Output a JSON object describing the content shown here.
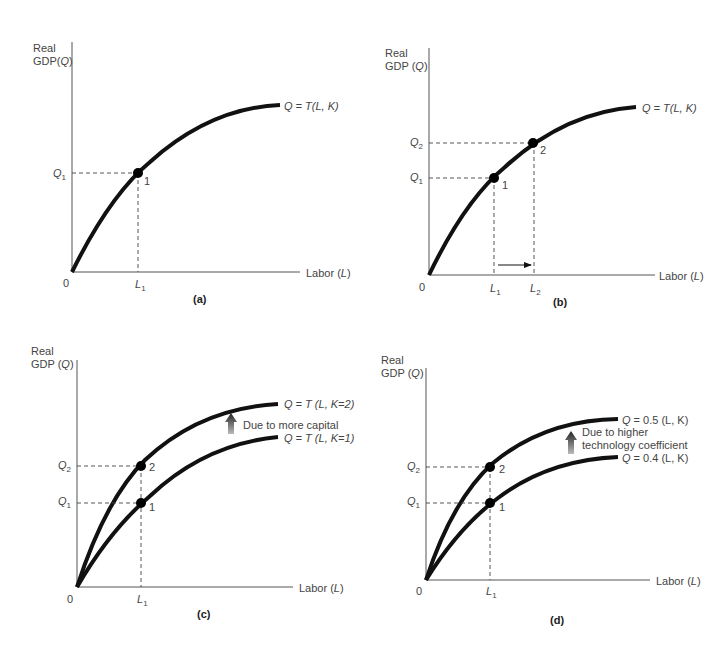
{
  "figure": {
    "panels": [
      {
        "id": "a",
        "caption": "(a)",
        "y_label_line1": "Real",
        "y_label_line2": "GDP(",
        "y_label_var": "Q",
        "x_label": "Labor (",
        "x_label_var": "L",
        "origin": "0",
        "curves": [
          {
            "label_pre": "Q",
            "label_text": " = T(L, K)"
          }
        ],
        "q_ticks": [
          {
            "base": "Q",
            "sub": "1"
          }
        ],
        "l_ticks": [
          {
            "base": "L",
            "sub": "1"
          }
        ],
        "points": [
          "1"
        ]
      },
      {
        "id": "b",
        "caption": "(b)",
        "y_label_line1": "Real",
        "y_label_line2": "GDP (",
        "y_label_var": "Q",
        "x_label": "Labor (",
        "x_label_var": "L",
        "origin": "0",
        "curves": [
          {
            "label_pre": "Q",
            "label_text": " = T(L, K)"
          }
        ],
        "q_ticks": [
          {
            "base": "Q",
            "sub": "1"
          },
          {
            "base": "Q",
            "sub": "2"
          }
        ],
        "l_ticks": [
          {
            "base": "L",
            "sub": "1"
          },
          {
            "base": "L",
            "sub": "2"
          }
        ],
        "points": [
          "1",
          "2"
        ],
        "annotation": "arrow from L1 to L2 (increase in labor)"
      },
      {
        "id": "c",
        "caption": "(c)",
        "y_label_line1": "Real",
        "y_label_line2": "GDP (",
        "y_label_var": "Q",
        "x_label": "Labor (",
        "x_label_var": "L",
        "origin": "0",
        "curves": [
          {
            "label_pre": "Q",
            "label_text": " = T (L, K=2)"
          },
          {
            "label_pre": "Q",
            "label_text": " = T (L, K=1)"
          }
        ],
        "shift_note": "Due to more capital",
        "q_ticks": [
          {
            "base": "Q",
            "sub": "1"
          },
          {
            "base": "Q",
            "sub": "2"
          }
        ],
        "l_ticks": [
          {
            "base": "L",
            "sub": "1"
          }
        ],
        "points": [
          "1",
          "2"
        ]
      },
      {
        "id": "d",
        "caption": "(d)",
        "y_label_line1": "Real",
        "y_label_line2": "GDP (",
        "y_label_var": "Q",
        "x_label": "Labor (",
        "x_label_var": "L",
        "origin": "0",
        "curves": [
          {
            "label_pre": "Q",
            "label_text": " = 0.5 (L, K)"
          },
          {
            "label_pre": "Q",
            "label_text": " = 0.4 (L, K)"
          }
        ],
        "shift_note_line1": "Due to higher",
        "shift_note_line2": "technology coefficient",
        "q_ticks": [
          {
            "base": "Q",
            "sub": "1"
          },
          {
            "base": "Q",
            "sub": "2"
          }
        ],
        "l_ticks": [
          {
            "base": "L",
            "sub": "1"
          }
        ],
        "points": [
          "1",
          "2"
        ]
      }
    ],
    "colors": {
      "curve": "#111111",
      "axis": "#555555",
      "text": "#444444",
      "background": "#ffffff"
    }
  }
}
